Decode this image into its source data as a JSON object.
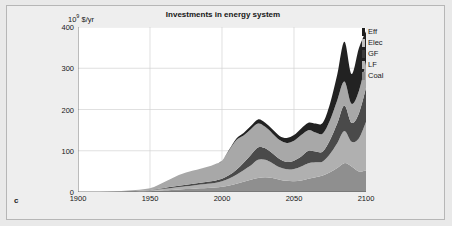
{
  "figure": {
    "panel_label": "c",
    "background_color": "#e9e9e9",
    "frame_color": "#b6b6b6"
  },
  "chart_data": {
    "type": "area",
    "stacked": true,
    "title": "Investments in energy system",
    "xlabel": "",
    "ylabel": "10⁹ $/yr",
    "ylabel_base": "10",
    "ylabel_exp": "9",
    "ylabel_rest": " $/yr",
    "xlim": [
      1900,
      2100
    ],
    "ylim": [
      0,
      400
    ],
    "grid": true,
    "legend_position": "right-outside",
    "xticks": [
      1900,
      1950,
      2000,
      2050,
      2100
    ],
    "xtick_labels": [
      "1900",
      "1950",
      "2000",
      "2050",
      "2100"
    ],
    "yticks": [
      0,
      100,
      200,
      300,
      400
    ],
    "ytick_labels": [
      "0",
      "100",
      "200",
      "300",
      "400"
    ],
    "x": [
      1900,
      1910,
      1920,
      1930,
      1940,
      1950,
      1955,
      1960,
      1965,
      1970,
      1975,
      1980,
      1985,
      1990,
      1995,
      2000,
      2005,
      2010,
      2015,
      2020,
      2025,
      2030,
      2035,
      2040,
      2045,
      2050,
      2055,
      2060,
      2065,
      2070,
      2075,
      2080,
      2085,
      2090,
      2095,
      2100
    ],
    "series": [
      {
        "name": "Coal",
        "color": "#8f8f8f",
        "legend_swatch": "#8a8a8a",
        "values": [
          0,
          0,
          0,
          0.5,
          1,
          2,
          3,
          4,
          5,
          6,
          7,
          8,
          9,
          10,
          11,
          13,
          16,
          20,
          25,
          30,
          34,
          36,
          34,
          30,
          27,
          26,
          28,
          32,
          36,
          40,
          48,
          58,
          70,
          62,
          50,
          52
        ]
      },
      {
        "name": "LF",
        "color": "#b0b0b0",
        "legend_swatch": "#b5b5b5",
        "values": [
          0,
          0,
          0,
          0.5,
          1,
          2,
          3,
          4,
          5,
          6,
          7,
          8,
          9,
          10,
          11,
          13,
          17,
          22,
          28,
          34,
          44,
          42,
          36,
          30,
          28,
          30,
          34,
          38,
          36,
          34,
          44,
          60,
          78,
          60,
          80,
          118
        ]
      },
      {
        "name": "GF",
        "color": "#4a4a4a",
        "legend_swatch": "#3c3c3c",
        "values": [
          0,
          0,
          0,
          0.3,
          0.6,
          1,
          1.5,
          2,
          2.5,
          3,
          3.5,
          4,
          4.5,
          5,
          5.5,
          6,
          8,
          12,
          18,
          26,
          30,
          28,
          24,
          20,
          18,
          20,
          24,
          30,
          26,
          24,
          34,
          48,
          62,
          46,
          60,
          82
        ]
      },
      {
        "name": "Elec",
        "color": "#a8a8a8",
        "legend_swatch": "#c0c0c0",
        "values": [
          0,
          0,
          0.5,
          1,
          2,
          4,
          8,
          14,
          20,
          26,
          30,
          32,
          34,
          36,
          40,
          44,
          60,
          72,
          66,
          62,
          58,
          52,
          48,
          46,
          46,
          48,
          52,
          50,
          46,
          44,
          48,
          56,
          58,
          46,
          54,
          64
        ]
      },
      {
        "name": "Eff",
        "color": "#222222",
        "legend_swatch": "#1e1e1e",
        "values": [
          0,
          0,
          0,
          0,
          0,
          0,
          0,
          0,
          0,
          0,
          0,
          0,
          0,
          0,
          0,
          0,
          2,
          4,
          6,
          8,
          10,
          10,
          10,
          10,
          12,
          14,
          16,
          18,
          22,
          26,
          40,
          62,
          96,
          72,
          104,
          74
        ]
      }
    ],
    "legend_entries": [
      "Eff",
      "Elec",
      "GF",
      "LF",
      "Coal"
    ]
  }
}
